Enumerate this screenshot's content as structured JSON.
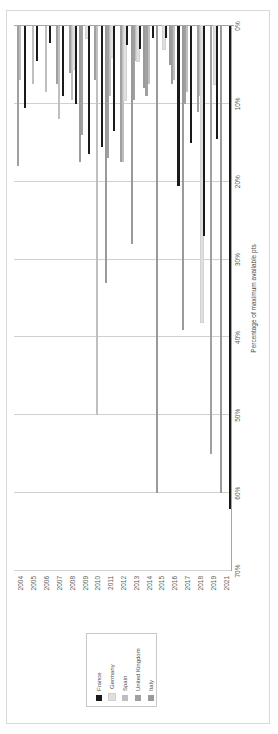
{
  "chart_data": {
    "type": "bar",
    "orientation": "horizontal",
    "title": "",
    "xlabel": "Percentage of maximum available pts",
    "ylabel": "",
    "xlim": [
      0,
      70
    ],
    "xticks": [
      "0%",
      "10%",
      "20%",
      "30%",
      "40%",
      "50%",
      "60%",
      "70%"
    ],
    "xtick_values": [
      0,
      10,
      20,
      30,
      40,
      50,
      60,
      70
    ],
    "grid": true,
    "legend_position": "top-left",
    "categories": [
      "2004",
      "2005",
      "2006",
      "2007",
      "2008",
      "2009",
      "2010",
      "2011",
      "2012",
      "2013",
      "2014",
      "2015",
      "2016",
      "2017",
      "2018",
      "2019",
      "2021"
    ],
    "series": [
      {
        "name": "France",
        "color": "#1a1a1a",
        "values": [
          10.5,
          4.5,
          2.2,
          9.0,
          10.0,
          16.5,
          15.5,
          13.5,
          2.5,
          3.0,
          1.5,
          1.5,
          20.5,
          15.0,
          27.0,
          14.5,
          62.0
        ]
      },
      {
        "name": "Germany",
        "color": "#e0e0e0",
        "values": [
          0.0,
          0.0,
          0.0,
          0.0,
          5.5,
          1.5,
          0.0,
          4.0,
          9.5,
          4.5,
          0.0,
          3.0,
          0.0,
          0.0,
          38.0,
          7.5,
          0.0
        ]
      },
      {
        "name": "Spain",
        "color": "#bfbfbf",
        "values": [
          7.0,
          7.5,
          8.5,
          12.0,
          9.5,
          0.0,
          50.0,
          9.0,
          17.5,
          4.5,
          7.5,
          0.0,
          7.0,
          8.5,
          9.0,
          0.0,
          0.0
        ]
      },
      {
        "name": "United Kingdom",
        "color": "#a0a0a0",
        "values": [
          18.0,
          0.0,
          0.0,
          7.5,
          6.0,
          14.0,
          7.0,
          17.0,
          17.5,
          9.5,
          9.0,
          0.0,
          7.5,
          10.0,
          11.0,
          55.0,
          0.0
        ]
      },
      {
        "name": "Italy",
        "color": "#9a9a9a",
        "values": [
          0.0,
          0.0,
          0.0,
          0.0,
          0.0,
          17.5,
          0.0,
          33.0,
          0.0,
          28.0,
          8.0,
          60.0,
          5.0,
          39.0,
          0.0,
          0.0,
          60.0
        ]
      }
    ]
  },
  "legend": {
    "entries": [
      {
        "label": "France",
        "color": "#1a1a1a"
      },
      {
        "label": "Germany",
        "color": "#e0e0e0"
      },
      {
        "label": "Spain",
        "color": "#bfbfbf"
      },
      {
        "label": "United Kingdom",
        "color": "#a0a0a0"
      },
      {
        "label": "Italy",
        "color": "#9a9a9a"
      }
    ]
  },
  "axes": {
    "value_axis_title": "Percentage of maximum available pts",
    "value_axis_ticks": [
      "0%",
      "10%",
      "20%",
      "30%",
      "40%",
      "50%",
      "60%",
      "70%"
    ],
    "category_axis_labels": [
      "2004",
      "2005",
      "2006",
      "2007",
      "2008",
      "2009",
      "2010",
      "2011",
      "2012",
      "2013",
      "2014",
      "2015",
      "2016",
      "2017",
      "2018",
      "2019",
      "2021"
    ]
  },
  "colors": {
    "gridline": "#d0d0d0",
    "axis": "#a6a6a6",
    "text": "#595959",
    "frame": "#d9d9d9",
    "background": "#ffffff"
  }
}
